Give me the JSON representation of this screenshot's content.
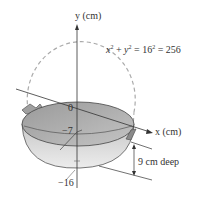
{
  "figure": {
    "y_axis_label": "y (cm)",
    "x_axis_label": "x (cm)",
    "equation": {
      "var1": "x",
      "var2": "y",
      "radius": "16",
      "value": "256",
      "plus": "+",
      "equals": "="
    },
    "ticks": {
      "origin": "0",
      "water_level": "−7",
      "bottom": "−16"
    },
    "depth_label": "9 cm deep"
  },
  "colors": {
    "ink": "#333333",
    "bowl_outer": "#d9d9d9",
    "bowl_inner": "#a8a8a8",
    "dashed_circle": "#aaaaaa"
  }
}
